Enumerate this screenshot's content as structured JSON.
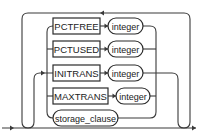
{
  "diagram": {
    "type": "syntax-railroad",
    "items": [
      {
        "keyword": "PCTFREE",
        "param": "integer"
      },
      {
        "keyword": "PCTUSED",
        "param": "integer"
      },
      {
        "keyword": "INITRANS",
        "param": "integer"
      },
      {
        "keyword": "MAXTRANS",
        "param": "integer"
      },
      {
        "nonterminal": "storage_clause"
      }
    ],
    "colors": {
      "line": "#3a3a3a",
      "background": "#ffffff"
    }
  }
}
